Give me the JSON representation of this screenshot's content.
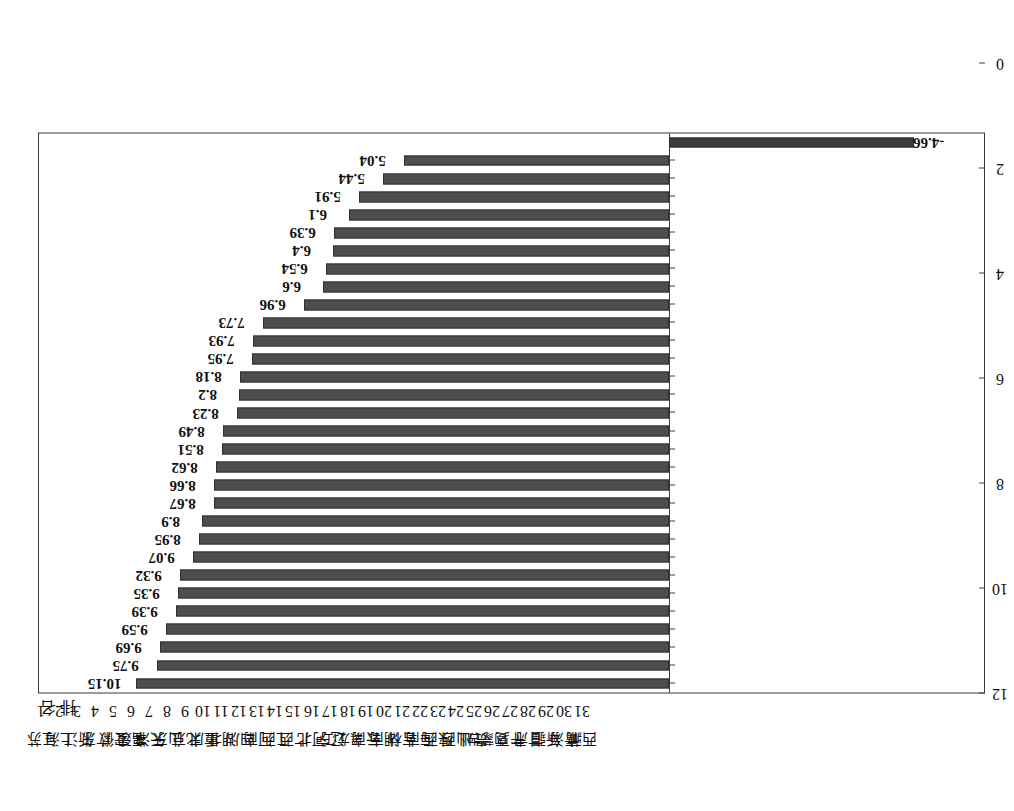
{
  "figure": {
    "orientation": "rotated-90",
    "axis_header_rank": "排 名",
    "bar_color": "#4e4e4e",
    "frame_color": "#3b3b3b"
  },
  "chart_data": {
    "type": "bar",
    "title": "",
    "subtitle": "",
    "xlabel": "",
    "ylabel": "",
    "grid": false,
    "legend": null,
    "ylim": [
      -6,
      12
    ],
    "yticks": [
      -6,
      -4,
      -2,
      0,
      2,
      4,
      6,
      8,
      10,
      12
    ],
    "ytick_labels": [
      "-6",
      "-4",
      "-2",
      "0",
      "2",
      "4",
      "6",
      "8",
      "10",
      "12"
    ],
    "categories": [
      "江苏",
      "上海",
      "浙江",
      "广东",
      "安徽",
      "福建",
      "天津",
      "山东",
      "北京",
      "重庆",
      "湖北",
      "四川",
      "河南",
      "江西",
      "广西",
      "河北",
      "辽宁",
      "黑龙江",
      "云南",
      "湖南",
      "吉林",
      "海南",
      "陕西",
      "山西",
      "贵州",
      "内蒙古",
      "宁夏",
      "甘肃",
      "新疆",
      "青海",
      "西藏"
    ],
    "ranks": [
      "1",
      "2",
      "3",
      "4",
      "5",
      "6",
      "7",
      "8",
      "9",
      "10",
      "11",
      "12",
      "13",
      "14",
      "15",
      "16",
      "17",
      "18",
      "19",
      "20",
      "21",
      "22",
      "23",
      "24",
      "25",
      "26",
      "27",
      "28",
      "29",
      "30",
      "31"
    ],
    "values": [
      10.15,
      9.75,
      9.69,
      9.59,
      9.39,
      9.35,
      9.32,
      9.07,
      8.95,
      8.9,
      8.67,
      8.66,
      8.62,
      8.51,
      8.49,
      8.23,
      8.2,
      8.18,
      7.95,
      7.93,
      7.73,
      6.96,
      6.6,
      6.54,
      6.4,
      6.39,
      6.1,
      5.91,
      5.44,
      5.04,
      -4.66
    ],
    "value_labels": [
      "10.15",
      "9.75",
      "9.69",
      "9.59",
      "9.39",
      "9.35",
      "9.32",
      "9.07",
      "8.95",
      "8.9",
      "8.67",
      "8.66",
      "8.62",
      "8.51",
      "8.49",
      "8.23",
      "8.2",
      "8.18",
      "7.95",
      "7.93",
      "7.73",
      "6.96",
      "6.6",
      "6.54",
      "6.4",
      "6.39",
      "6.1",
      "5.91",
      "5.44",
      "5.04",
      "-4.66"
    ]
  }
}
